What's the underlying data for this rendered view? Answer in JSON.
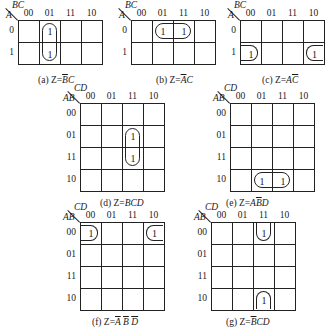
{
  "maps": [
    {
      "id": "a",
      "var_row": "A",
      "var_col": "BC",
      "col_labels": [
        "00",
        "01",
        "11",
        "10"
      ],
      "row_labels": [
        "0",
        "1"
      ],
      "cells": [
        [
          "",
          "1",
          "",
          ""
        ],
        [
          "",
          "1",
          "",
          ""
        ]
      ],
      "caption_prefix": "(a) Z=",
      "caption_expr": [
        {
          "t": "B",
          "ov": true
        },
        {
          "t": "C",
          "ov": false
        }
      ]
    },
    {
      "id": "b",
      "var_row": "A",
      "var_col": "BC",
      "col_labels": [
        "00",
        "01",
        "11",
        "10"
      ],
      "row_labels": [
        "0",
        "1"
      ],
      "cells": [
        [
          "",
          "1",
          "1",
          ""
        ],
        [
          "",
          "",
          "",
          ""
        ]
      ],
      "caption_prefix": "(b) Z=",
      "caption_expr": [
        {
          "t": "A",
          "ov": true
        },
        {
          "t": "C",
          "ov": false
        }
      ]
    },
    {
      "id": "c",
      "var_row": "A",
      "var_col": "BC",
      "col_labels": [
        "00",
        "01",
        "11",
        "10"
      ],
      "row_labels": [
        "0",
        "1"
      ],
      "cells": [
        [
          "",
          "",
          "",
          ""
        ],
        [
          "1",
          "",
          "",
          "1"
        ]
      ],
      "caption_prefix": "(c) Z=",
      "caption_expr": [
        {
          "t": "A",
          "ov": false
        },
        {
          "t": "C",
          "ov": true
        }
      ]
    },
    {
      "id": "d",
      "var_row": "AB",
      "var_col": "CD",
      "col_labels": [
        "00",
        "01",
        "11",
        "10"
      ],
      "row_labels": [
        "00",
        "01",
        "11",
        "10"
      ],
      "cells": [
        [
          "",
          "",
          "",
          ""
        ],
        [
          "",
          "",
          "1",
          ""
        ],
        [
          "",
          "",
          "1",
          ""
        ],
        [
          "",
          "",
          "",
          ""
        ]
      ],
      "caption_prefix": "(d) Z=",
      "caption_expr": [
        {
          "t": "BCD",
          "ov": false
        }
      ]
    },
    {
      "id": "e",
      "var_row": "AB",
      "var_col": "CD",
      "col_labels": [
        "00",
        "01",
        "11",
        "10"
      ],
      "row_labels": [
        "00",
        "01",
        "11",
        "10"
      ],
      "cells": [
        [
          "",
          "",
          "",
          ""
        ],
        [
          "",
          "",
          "",
          ""
        ],
        [
          "",
          "",
          "",
          ""
        ],
        [
          "",
          "1",
          "1",
          ""
        ]
      ],
      "caption_prefix": "(e) Z=",
      "caption_expr": [
        {
          "t": "A",
          "ov": false
        },
        {
          "t": "B",
          "ov": true
        },
        {
          "t": "D",
          "ov": false
        }
      ]
    },
    {
      "id": "f",
      "var_row": "AB",
      "var_col": "CD",
      "col_labels": [
        "00",
        "01",
        "11",
        "10"
      ],
      "row_labels": [
        "00",
        "01",
        "11",
        "10"
      ],
      "cells": [
        [
          "1",
          "",
          "",
          "1"
        ],
        [
          "",
          "",
          "",
          ""
        ],
        [
          "",
          "",
          "",
          ""
        ],
        [
          "",
          "",
          "",
          ""
        ]
      ],
      "caption_prefix": "(f) Z=",
      "caption_expr": [
        {
          "t": "A",
          "ov": true
        },
        {
          "t": " ",
          "ov": false
        },
        {
          "t": "B",
          "ov": true
        },
        {
          "t": " ",
          "ov": false
        },
        {
          "t": "D",
          "ov": true
        }
      ]
    },
    {
      "id": "g",
      "var_row": "AB",
      "var_col": "CD",
      "col_labels": [
        "00",
        "01",
        "11",
        "10"
      ],
      "row_labels": [
        "00",
        "01",
        "11",
        "10"
      ],
      "cells": [
        [
          "",
          "",
          "1",
          ""
        ],
        [
          "",
          "",
          "",
          ""
        ],
        [
          "",
          "",
          "",
          ""
        ],
        [
          "",
          "",
          "1",
          ""
        ]
      ],
      "caption_prefix": "(g) Z=",
      "caption_expr": [
        {
          "t": "B",
          "ov": true
        },
        {
          "t": "CD",
          "ov": false
        }
      ]
    }
  ]
}
